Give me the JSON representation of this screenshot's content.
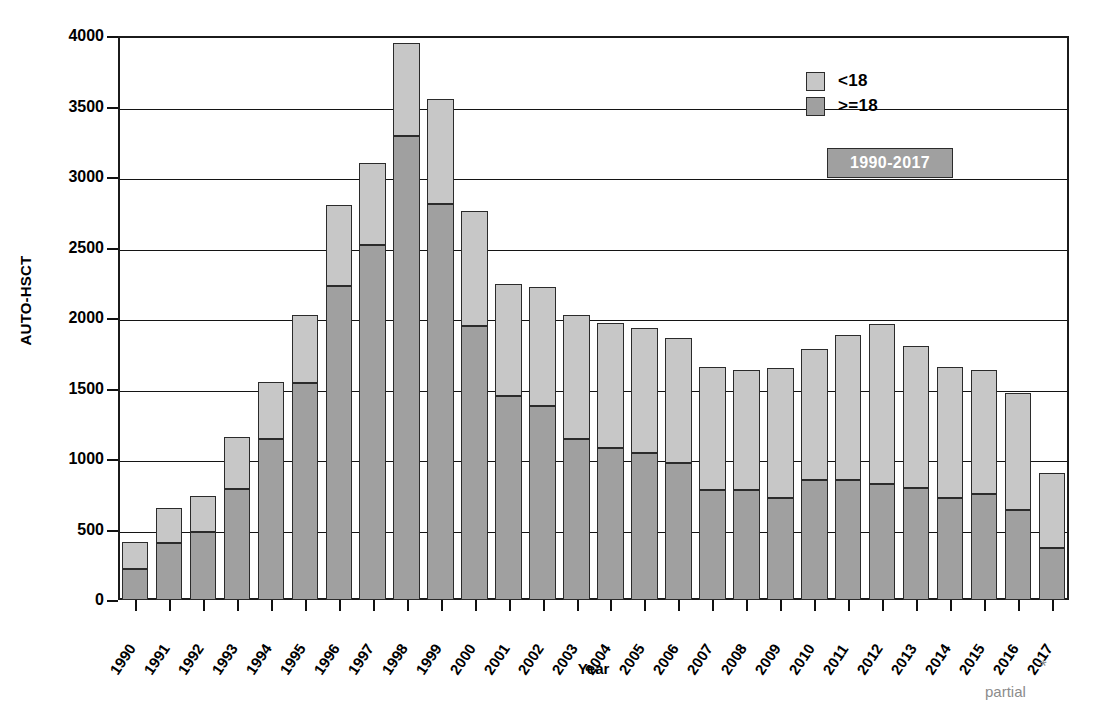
{
  "chart_data": {
    "type": "bar",
    "title": "",
    "xlabel": "Year",
    "ylabel": "AUTO-HSCT",
    "ylim": [
      0,
      4000
    ],
    "ytick_step": 500,
    "yticks": [
      0,
      500,
      1000,
      1500,
      2000,
      2500,
      3000,
      3500,
      4000
    ],
    "grid": true,
    "stacked": true,
    "legend_position": "top-right",
    "categories": [
      "1990",
      "1991",
      "1992",
      "1993",
      "1994",
      "1995",
      "1996",
      "1997",
      "1998",
      "1999",
      "2000",
      "2001",
      "2002",
      "2003",
      "2004",
      "2005",
      "2006",
      "2007",
      "2008",
      "2009",
      "2010",
      "2011",
      "2012",
      "2013",
      "2014",
      "2015",
      "2016",
      "2017"
    ],
    "series": [
      {
        "name": ">=18",
        "color": "#a0a0a0",
        "values": [
          220,
          405,
          480,
          790,
          1140,
          1540,
          2225,
          2520,
          3290,
          2810,
          1940,
          1450,
          1375,
          1145,
          1080,
          1040,
          970,
          780,
          780,
          720,
          850,
          850,
          825,
          795,
          720,
          750,
          640,
          370
        ]
      },
      {
        "name": "<18",
        "color": "#c7c7c7",
        "values": [
          190,
          250,
          255,
          365,
          405,
          480,
          580,
          580,
          660,
          740,
          820,
          790,
          845,
          875,
          885,
          890,
          890,
          870,
          850,
          925,
          930,
          1030,
          1130,
          1005,
          930,
          880,
          830,
          530
        ]
      }
    ],
    "totals": [
      410,
      655,
      735,
      1155,
      1545,
      2020,
      2805,
      3100,
      3950,
      3550,
      2760,
      2240,
      2220,
      2020,
      1965,
      1930,
      1860,
      1650,
      1630,
      1645,
      1780,
      1880,
      1955,
      1800,
      1650,
      1630,
      1470,
      900
    ],
    "annotations": {
      "range_badge": "1990-2017",
      "partial_marker": "*",
      "partial_label": "partial",
      "partial_category": "2017"
    }
  },
  "legend": {
    "items": [
      {
        "label": "<18",
        "swatch_color": "#c7c7c7"
      },
      {
        "label": ">=18",
        "swatch_color": "#a0a0a0"
      }
    ]
  },
  "axes": {
    "y_title": "AUTO-HSCT",
    "x_title": "Year"
  }
}
